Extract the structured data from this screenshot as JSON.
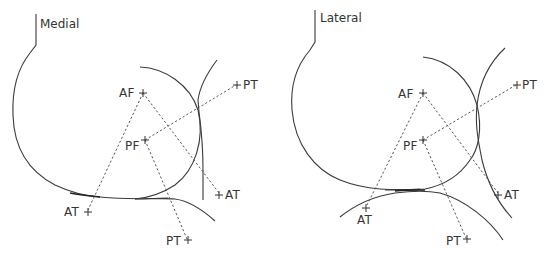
{
  "panels": [
    {
      "title": "Medial",
      "labels": {
        "af": "AF",
        "pf": "PF",
        "pt_upper": "PT",
        "at_right": "AT",
        "at_left": "AT",
        "pt_lower": "PT"
      }
    },
    {
      "title": "Lateral",
      "labels": {
        "af": "AF",
        "pf": "PF",
        "pt_upper": "PT",
        "at_right": "AT",
        "at_left": "AT",
        "pt_lower": "PT"
      }
    }
  ],
  "colors": {
    "line": "#3a3a3a",
    "dashed": "#555555",
    "background": "#ffffff"
  }
}
